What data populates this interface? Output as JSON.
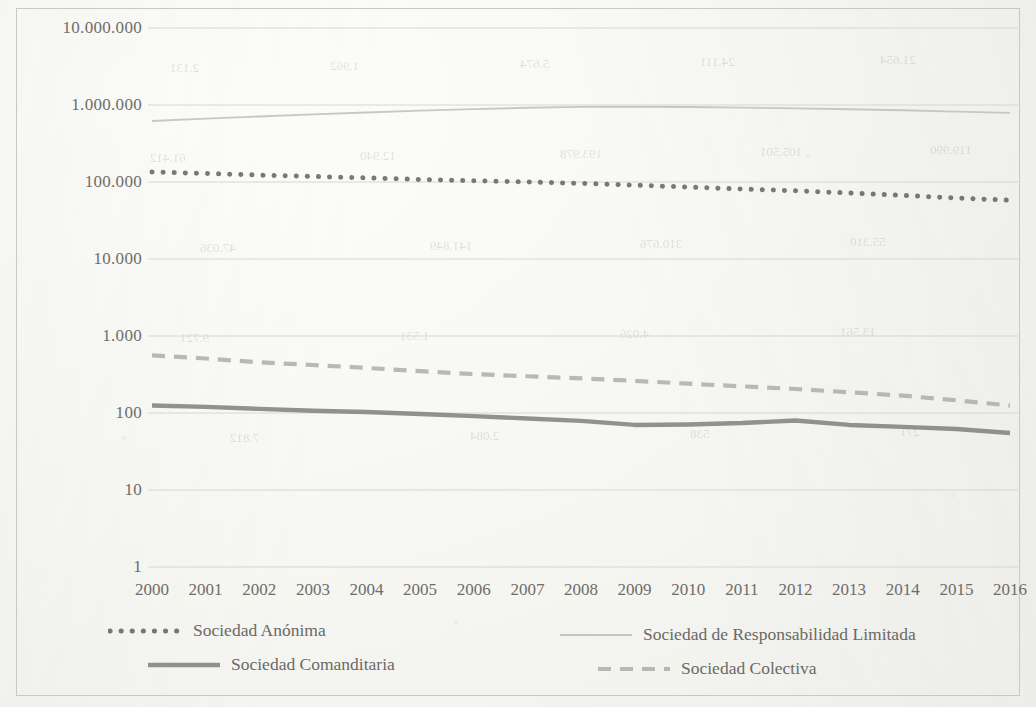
{
  "chart_data": {
    "type": "line",
    "title": "",
    "subtitle": "",
    "xlabel": "",
    "ylabel": "",
    "yscale": "log",
    "ylim": [
      1,
      10000000
    ],
    "grid": true,
    "legend_position": "bottom",
    "y_ticks": [
      "1",
      "10",
      "100",
      "1.000",
      "10.000",
      "100.000",
      "1.000.000",
      "10.000.000"
    ],
    "y_tick_values": [
      1,
      10,
      100,
      1000,
      10000,
      100000,
      1000000,
      10000000
    ],
    "categories": [
      "2000",
      "2001",
      "2002",
      "2003",
      "2004",
      "2005",
      "2006",
      "2007",
      "2008",
      "2009",
      "2010",
      "2011",
      "2012",
      "2013",
      "2014",
      "2015",
      "2016"
    ],
    "series": [
      {
        "name": "Sociedad Anónima",
        "style": "dotted",
        "color": "#6e6c66",
        "values": [
          135000,
          129000,
          123000,
          118000,
          113000,
          108000,
          104000,
          100000,
          96000,
          91000,
          86000,
          81000,
          77000,
          72000,
          67000,
          62000,
          58000
        ]
      },
      {
        "name": "Sociedad de Responsabilidad Limitada",
        "style": "solid-thin",
        "color": "#c3c3be",
        "values": [
          620000,
          665000,
          710000,
          755000,
          800000,
          845000,
          885000,
          920000,
          945000,
          950000,
          940000,
          925000,
          905000,
          880000,
          855000,
          820000,
          790000
        ]
      },
      {
        "name": "Sociedad Comanditaria",
        "style": "solid-thick",
        "color": "#8a8882",
        "values": [
          125,
          120,
          113,
          107,
          103,
          97,
          91,
          85,
          79,
          70,
          71,
          74,
          80,
          70,
          66,
          62,
          55
        ]
      },
      {
        "name": "Sociedad Colectiva",
        "style": "dashed",
        "color": "#b3b2ad",
        "values": [
          560,
          510,
          455,
          420,
          385,
          350,
          320,
          300,
          282,
          262,
          240,
          222,
          205,
          186,
          168,
          146,
          125
        ]
      }
    ]
  },
  "legend": {
    "items": [
      {
        "label": "Sociedad Anónima",
        "swatch": "dotted-line-swatch"
      },
      {
        "label": "Sociedad de Responsabilidad Limitada",
        "swatch": "solid-thin-line-swatch"
      },
      {
        "label": "Sociedad Comanditaria",
        "swatch": "solid-thick-line-swatch"
      },
      {
        "label": "Sociedad Colectiva",
        "swatch": "dashed-line-swatch"
      }
    ]
  },
  "bleed_through_text": [
    "2.131",
    "1.962",
    "5.674",
    "24.111",
    "21.654",
    "61.412",
    "12.940",
    "193.978",
    "105.501",
    "119.990",
    "47.036",
    "141.849",
    "310.676",
    "55.310",
    "9.721",
    "1.531",
    "4.026",
    "13.561",
    "7.812",
    "2.084",
    "538",
    "271"
  ],
  "colors": {
    "axis_text": "#6f6d68",
    "gridline": "#d6d6d1",
    "frame": "#c9c9c4",
    "paper": "#f7f7f4"
  }
}
